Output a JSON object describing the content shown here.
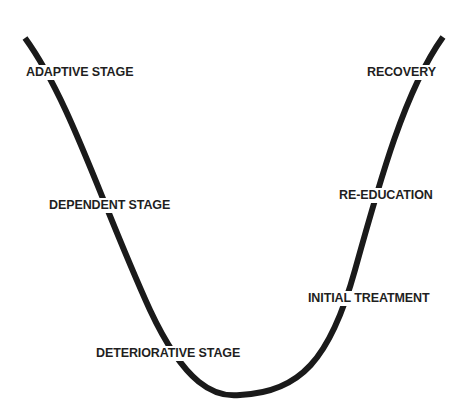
{
  "diagram": {
    "type": "u-curve",
    "curve_color": "#1a1a1a",
    "background": "#ffffff",
    "left_branch_labels": [
      {
        "text": "ADAPTIVE STAGE",
        "x": 26,
        "y": 66
      },
      {
        "text": "DEPENDENT STAGE",
        "x": 49,
        "y": 199
      },
      {
        "text": "DETERIORATIVE STAGE",
        "x": 96,
        "y": 347
      }
    ],
    "right_branch_labels": [
      {
        "text": "RECOVERY",
        "x": 366,
        "y": 66
      },
      {
        "text": "RE-EDUCATION",
        "x": 338,
        "y": 189
      },
      {
        "text": "INITIAL TREATMENT",
        "x": 307,
        "y": 292
      }
    ]
  }
}
